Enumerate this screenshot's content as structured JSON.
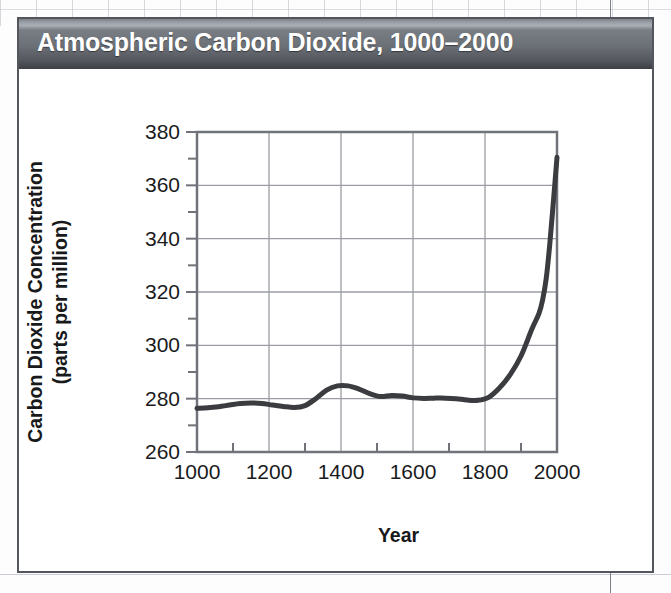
{
  "figure": {
    "title": "Atmospheric Carbon Dioxide, 1000–2000",
    "title_bar_color": "#6b6f76",
    "title_text_color": "#ffffff",
    "frame_color": "#53565c",
    "background_color": "#ffffff"
  },
  "chart_data": {
    "type": "line",
    "title": "Atmospheric Carbon Dioxide, 1000–2000",
    "xlabel": "Year",
    "ylabel": "Carbon Dioxide Concentration (parts per million)",
    "ylabel_line1": "Carbon Dioxide Concentration",
    "ylabel_line2": "(parts per million)",
    "xlim": [
      1000,
      2000
    ],
    "ylim": [
      260,
      380
    ],
    "x_major_ticks": [
      1000,
      1200,
      1400,
      1600,
      1800,
      2000
    ],
    "x_minor_ticks": [
      1100,
      1300,
      1500,
      1700,
      1900
    ],
    "y_major_ticks": [
      260,
      280,
      300,
      320,
      340,
      360,
      380
    ],
    "y_minor_ticks": [
      270,
      290,
      310,
      330,
      350,
      370
    ],
    "x_tick_labels": [
      "1000",
      "1200",
      "1400",
      "1600",
      "1800",
      "2000"
    ],
    "y_tick_labels": [
      "260",
      "280",
      "300",
      "320",
      "340",
      "360",
      "380"
    ],
    "grid": true,
    "grid_color": "#9a9da3",
    "legend": false,
    "line_color": "#3a3c40",
    "line_width": 5,
    "series": [
      {
        "name": "CO2 concentration",
        "x": [
          1000,
          1030,
          1060,
          1090,
          1120,
          1150,
          1180,
          1210,
          1240,
          1270,
          1300,
          1330,
          1360,
          1390,
          1420,
          1450,
          1480,
          1510,
          1540,
          1570,
          1600,
          1630,
          1660,
          1690,
          1720,
          1750,
          1780,
          1810,
          1840,
          1870,
          1900,
          1930,
          1950,
          1960,
          1970,
          1980,
          1990,
          2000
        ],
        "y": [
          276.4,
          276.6,
          277.0,
          277.6,
          278.2,
          278.4,
          278.2,
          277.6,
          277.1,
          276.7,
          277.4,
          280.0,
          283.2,
          284.8,
          284.8,
          283.6,
          281.9,
          280.8,
          281.2,
          281.0,
          280.3,
          280.1,
          280.2,
          280.2,
          280.0,
          279.5,
          279.4,
          280.5,
          284.0,
          289.0,
          296.0,
          306.0,
          312.0,
          317.0,
          325.0,
          338.0,
          354.0,
          370.5
        ]
      }
    ],
    "annotations": []
  }
}
